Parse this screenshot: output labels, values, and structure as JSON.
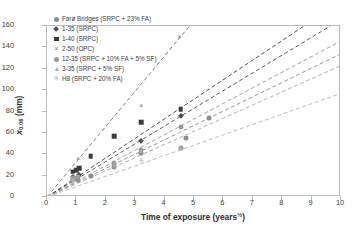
{
  "chart_data": {
    "type": "scatter",
    "title": "",
    "xlabel": "Time of exposure (years½)",
    "xlabel_base": "Time of exposure (years",
    "xlabel_sup": "½",
    "xlabel_tail": ")",
    "ylabel": "x0.06 (mm)",
    "ylabel_base": "x",
    "ylabel_sub": "0.06",
    "ylabel_tail": " (mm)",
    "xlim": [
      0,
      10
    ],
    "ylim": [
      0,
      160
    ],
    "xticks": [
      0,
      1,
      2,
      3,
      4,
      5,
      6,
      7,
      8,
      9,
      10
    ],
    "yticks": [
      0,
      20,
      40,
      60,
      80,
      100,
      120,
      140,
      160
    ],
    "grid": false,
    "legend_position": "top-left-inside",
    "trendline_style": "dashed",
    "series": [
      {
        "name": "Farø Bridges (SRPC + 23% FA)",
        "marker": "circle",
        "color": "#8d8d8d",
        "slope": 13.4,
        "points": [
          {
            "x": 0.9,
            "y": 15.5
          },
          {
            "x": 1.05,
            "y": 16.0
          },
          {
            "x": 1.5,
            "y": 19.5
          },
          {
            "x": 2.28,
            "y": 28.5
          },
          {
            "x": 3.2,
            "y": 41.5
          },
          {
            "x": 4.55,
            "y": 45.5
          },
          {
            "x": 4.72,
            "y": 55.5
          },
          {
            "x": 5.5,
            "y": 74.0
          }
        ]
      },
      {
        "name": "1-35 (SRPC)",
        "marker": "diamond",
        "color": "#4a4a4a",
        "slope": 16.6,
        "points": [
          {
            "x": 0.88,
            "y": 19.0
          },
          {
            "x": 1.08,
            "y": 21.0
          },
          {
            "x": 3.2,
            "y": 52.5
          },
          {
            "x": 4.55,
            "y": 75.5
          }
        ]
      },
      {
        "name": "1-40 (SRPC)",
        "marker": "square",
        "color": "#3a3a3a",
        "slope": 18.3,
        "points": [
          {
            "x": 0.88,
            "y": 23.5
          },
          {
            "x": 1.0,
            "y": 25.0
          },
          {
            "x": 1.1,
            "y": 27.0
          },
          {
            "x": 1.48,
            "y": 38.0
          },
          {
            "x": 2.28,
            "y": 57.0
          },
          {
            "x": 3.2,
            "y": 70.0
          },
          {
            "x": 4.55,
            "y": 82.0
          }
        ]
      },
      {
        "name": "2-50 (OPC)",
        "marker": "x",
        "color": "#6e6e6e",
        "slope": 33.0,
        "points": [
          {
            "x": 1.05,
            "y": 35.5
          },
          {
            "x": 3.2,
            "y": 85.5
          },
          {
            "x": 4.5,
            "y": 150.0
          }
        ]
      },
      {
        "name": "12-35 (SRPC + 10% FA + 5% SF)",
        "marker": "circle",
        "color": "#9a9a9a",
        "slope": 14.6,
        "points": [
          {
            "x": 0.9,
            "y": 18.0
          },
          {
            "x": 1.05,
            "y": 19.0
          },
          {
            "x": 2.28,
            "y": 31.5
          },
          {
            "x": 3.2,
            "y": 44.0
          },
          {
            "x": 4.55,
            "y": 65.5
          }
        ]
      },
      {
        "name": "3-35 (SRPC + 5% SF)",
        "marker": "triangle",
        "color": "#a8a8a8",
        "slope": 12.3,
        "points": [
          {
            "x": 0.9,
            "y": 16.0
          },
          {
            "x": 3.2,
            "y": 43.0
          },
          {
            "x": 4.55,
            "y": 45.5
          }
        ]
      },
      {
        "name": "H8 (SRPC + 20% FA)",
        "marker": "asterisk",
        "color": "#b5b5b5",
        "slope": 9.7,
        "points": [
          {
            "x": 0.9,
            "y": 15.0
          },
          {
            "x": 2.28,
            "y": 28.0
          },
          {
            "x": 3.2,
            "y": 33.5
          },
          {
            "x": 4.55,
            "y": 44.5
          }
        ]
      }
    ]
  }
}
